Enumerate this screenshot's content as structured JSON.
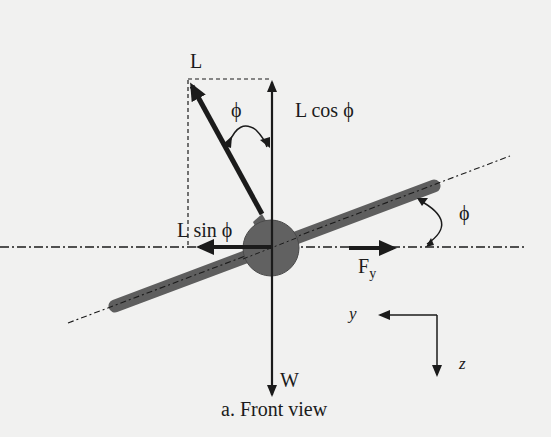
{
  "diagram": {
    "caption": "a. Front view",
    "colors": {
      "background": "#f1f1f0",
      "ink": "#1b1b1b",
      "fuselage": "#616161",
      "wing": "#5e5e5e"
    },
    "labels": {
      "lift": "L",
      "lift_vertical": "L cos ϕ",
      "lift_horizontal": "L sin ϕ",
      "bank_angle_top": "ϕ",
      "bank_angle_right": "ϕ",
      "side_force_main": "F",
      "side_force_sub": "y",
      "weight": "W",
      "axis_y": "y",
      "axis_z": "z"
    },
    "elements": [
      "lift-vector L (tilted by bank angle ϕ)",
      "vertical lift component L cos ϕ",
      "horizontal lift component L sin ϕ",
      "side force Fy",
      "weight W",
      "fuselage circle",
      "wing (banked)",
      "horizontal reference line",
      "wing axis line",
      "body axes y (left) and z (down)"
    ]
  }
}
